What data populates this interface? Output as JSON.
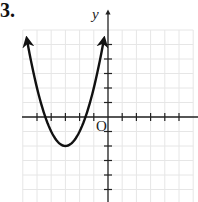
{
  "problem": {
    "number": "3."
  },
  "chart_data": {
    "type": "line",
    "title": "",
    "xlabel": "",
    "ylabel": "y",
    "origin_label": "O",
    "function": "y = (x + 3)^2 - 2",
    "vertex": [
      -3,
      -2
    ],
    "x_intercepts": [
      -4.41,
      -1.59
    ],
    "xlim": [
      -6,
      6
    ],
    "ylim": [
      -6,
      6
    ],
    "grid": true,
    "x_ticks": [
      -5,
      -4,
      -3,
      -2,
      -1,
      1,
      2,
      3,
      4,
      5
    ],
    "y_ticks": [
      -5,
      -4,
      -3,
      -2,
      -1,
      1,
      2,
      3,
      4,
      5
    ],
    "tick_labels_shown": false,
    "series": [
      {
        "name": "parabola",
        "x": [
          -5.7,
          -5,
          -4.5,
          -4,
          -3.5,
          -3,
          -2.5,
          -2,
          -1.5,
          -1,
          -0.3
        ],
        "y": [
          5.29,
          2,
          0.25,
          -1,
          -1.75,
          -2,
          -1.75,
          -1,
          0.25,
          2,
          5.29
        ],
        "arrows": "both ends"
      }
    ],
    "colors": {
      "curve": "#111111",
      "axes": "#222222",
      "grid": "#e6e6e6"
    }
  }
}
